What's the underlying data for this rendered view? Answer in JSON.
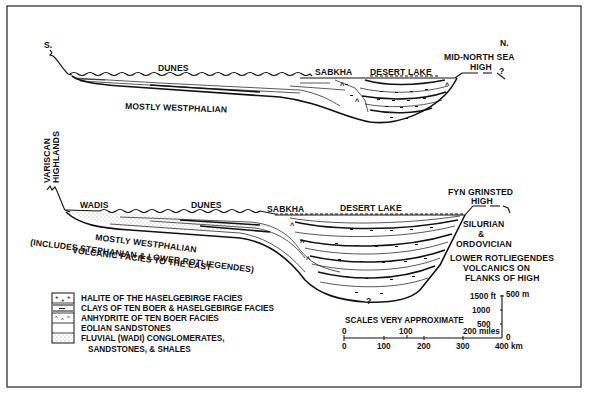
{
  "top_section": {
    "labels": {
      "south": "S.",
      "north": "N.",
      "dunes": "DUNES",
      "sabkha": "SABKHA",
      "desert_lake": "DESERT LAKE",
      "high_line1": "MID-NORTH SEA",
      "high_line2": "HIGH",
      "question": "?",
      "substrate": "MOSTLY WESTPHALIAN"
    }
  },
  "bottom_section": {
    "labels": {
      "highlands_line1": "VARISCAN",
      "highlands_line2": "HIGHLANDS",
      "wadis": "WADIS",
      "dunes": "DUNES",
      "sabkha": "SABKHA",
      "desert_lake": "DESERT LAKE",
      "high_line1": "FYN GRINSTED",
      "high_line2": "HIGH",
      "silurian_line1": "SILURIAN",
      "silurian_line2": "&",
      "silurian_line3": "ORDOVICIAN",
      "volcanics_line1": "LOWER ROTLIEGENDES",
      "volcanics_line2": "VOLCANICS ON",
      "volcanics_line3": "FLANKS OF HIGH",
      "substrate_line1": "MOSTLY WESTPHALIAN",
      "substrate_line2": "(INCLUDES STEPHANIAN & LOWER ROTLIEGENDES)",
      "substrate_line3": "VOLCANIC FACIES TO THE EAST",
      "question": "?"
    }
  },
  "legend": {
    "items": [
      {
        "pattern": "halite",
        "label": "HALITE OF THE HASELGEBIRGE FACIES"
      },
      {
        "pattern": "clay",
        "label": "CLAYS OF TEN BOER & HASELGEBIRGE FACIES"
      },
      {
        "pattern": "anhydrite",
        "label": "ANHYDRITE OF TEN BOER FACIES"
      },
      {
        "pattern": "eolian",
        "label": "EOLIAN SANDSTONES"
      },
      {
        "pattern": "fluvial",
        "label": "FLUVIAL (WADI) CONGLOMERATES,"
      }
    ],
    "continuation": "SANDSTONES, & SHALES"
  },
  "scale": {
    "title": "SCALES VERY APPROXIMATE",
    "miles_ticks": [
      "0",
      "100",
      "200 miles"
    ],
    "km_ticks": [
      "0",
      "100",
      "200",
      "300",
      "400 km"
    ],
    "vertical_ft_ticks": [
      "1500 ft",
      "1000",
      "500"
    ],
    "vertical_m_top": "500 m",
    "vertical_zero": "0"
  }
}
